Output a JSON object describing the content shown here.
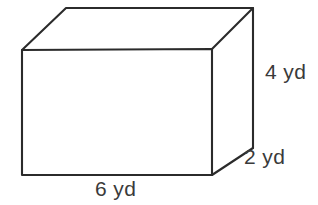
{
  "figure": {
    "name": "rectangular-prism",
    "shape_label": "rectangular prism",
    "unit": "yd",
    "background_color": "#ffffff",
    "stroke_color": "#2b2b2b",
    "text_color": "#3a3a3a",
    "face_fill_color": "#ffffff"
  },
  "dimensions": {
    "height": {
      "value": "4",
      "unit": "yd",
      "label": "4 yd",
      "edge": "vertical-right-back"
    },
    "depth": {
      "value": "2",
      "unit": "yd",
      "label": "2 yd",
      "edge": "diagonal-bottom-right"
    },
    "width": {
      "value": "6",
      "unit": "yd",
      "label": "6 yd",
      "edge": "horizontal-bottom-front"
    }
  },
  "geometry": {
    "front_face": {
      "top_left": [
        22,
        50
      ],
      "top_right": [
        212,
        49
      ],
      "bottom_right": [
        212,
        175
      ],
      "bottom_left": [
        22,
        175
      ]
    },
    "back_face_visible": {
      "top_left": [
        66,
        8
      ],
      "top_right": [
        253,
        8
      ],
      "bottom_right": [
        253,
        148
      ]
    },
    "hidden_edges_drawn": "none"
  }
}
